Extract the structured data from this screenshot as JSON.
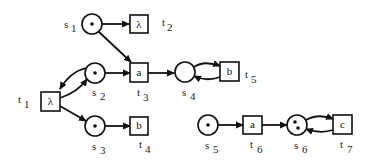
{
  "diagram": {
    "type": "petri-net",
    "places": [
      {
        "id": "s1",
        "label": "s",
        "sub": "1",
        "tokens": 1
      },
      {
        "id": "s2",
        "label": "s",
        "sub": "2",
        "tokens": 1
      },
      {
        "id": "s3",
        "label": "s",
        "sub": "3",
        "tokens": 1
      },
      {
        "id": "s4",
        "label": "s",
        "sub": "4",
        "tokens": 0
      },
      {
        "id": "s5",
        "label": "s",
        "sub": "5",
        "tokens": 1
      },
      {
        "id": "s6",
        "label": "s",
        "sub": "6",
        "tokens": 2
      }
    ],
    "transitions": [
      {
        "id": "t1",
        "label": "t",
        "sub": "1",
        "action": "λ"
      },
      {
        "id": "t2",
        "label": "t",
        "sub": "2",
        "action": "λ"
      },
      {
        "id": "t3",
        "label": "t",
        "sub": "3",
        "action": "a"
      },
      {
        "id": "t4",
        "label": "t",
        "sub": "4",
        "action": "b"
      },
      {
        "id": "t5",
        "label": "t",
        "sub": "5",
        "action": "b"
      },
      {
        "id": "t6",
        "label": "t",
        "sub": "6",
        "action": "a"
      },
      {
        "id": "t7",
        "label": "t",
        "sub": "7",
        "action": "c"
      }
    ],
    "arcs": [
      [
        "s1",
        "t2"
      ],
      [
        "s1",
        "t3"
      ],
      [
        "s2",
        "t3"
      ],
      [
        "s2",
        "t1"
      ],
      [
        "t1",
        "s2"
      ],
      [
        "t1",
        "s3"
      ],
      [
        "s3",
        "t4"
      ],
      [
        "t3",
        "s4"
      ],
      [
        "s4",
        "t5"
      ],
      [
        "t5",
        "s4"
      ],
      [
        "s5",
        "t6"
      ],
      [
        "t6",
        "s6"
      ],
      [
        "s6",
        "t7"
      ],
      [
        "t7",
        "s6"
      ]
    ]
  }
}
